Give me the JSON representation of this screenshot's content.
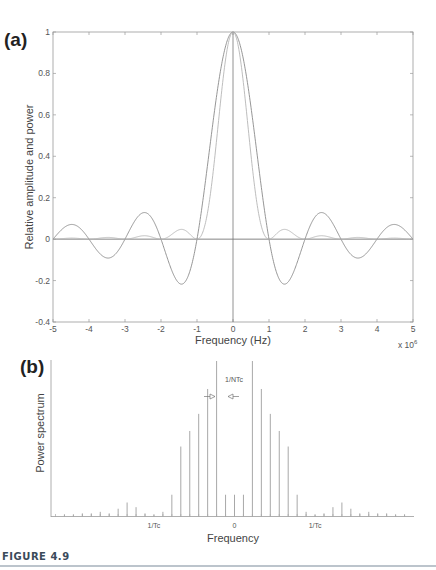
{
  "figure": {
    "caption": "FIGURE 4.9"
  },
  "chart_data": [
    {
      "panel_label": "(a)",
      "type": "line",
      "title": "",
      "xlabel": "Frequency (Hz)",
      "x_multiplier_label": "x 10",
      "x_multiplier_exponent": "6",
      "ylabel": "Relative amplitude and power",
      "xlim": [
        -5,
        5
      ],
      "ylim": [
        -0.4,
        1
      ],
      "xticks": [
        -5,
        -4,
        -3,
        -2,
        -1,
        0,
        1,
        2,
        3,
        4,
        5
      ],
      "xtick_labels": [
        "-5",
        "-4",
        "-3",
        "-2",
        "-1",
        "0",
        "1",
        "2",
        "3",
        "4",
        "5"
      ],
      "yticks": [
        -0.4,
        -0.2,
        0,
        0.2,
        0.4,
        0.6,
        0.8,
        1
      ],
      "ytick_labels": [
        "-0.4",
        "-0.2",
        "0",
        "0.2",
        "0.4",
        "0.6",
        "0.8",
        "1"
      ],
      "grid": false,
      "legend": "none",
      "series": [
        {
          "name": "Relative amplitude (sinc)",
          "function": "sin(pi*x)/(pi*x)",
          "color": "#8a8a8a",
          "key_points": {
            "x": [
              -4.5,
              -3.45,
              -2.46,
              -1.43,
              0,
              1.43,
              2.46,
              3.45,
              4.5
            ],
            "y": [
              0.07,
              -0.09,
              0.13,
              -0.22,
              1,
              -0.22,
              0.13,
              -0.09,
              0.07
            ]
          }
        },
        {
          "name": "Relative power (sinc squared)",
          "function": "(sin(pi*x)/(pi*x))^2",
          "color": "#b5b5b5",
          "key_points": {
            "x": [
              -1.43,
              0,
              1.43
            ],
            "y": [
              0.047,
              1,
              0.047
            ]
          }
        }
      ],
      "reference_lines": [
        {
          "type": "horizontal",
          "y": 0
        },
        {
          "type": "vertical",
          "x": 0
        }
      ]
    },
    {
      "panel_label": "(b)",
      "type": "bar",
      "title": "",
      "xlabel": "Frequency",
      "ylabel": "Power spectrum",
      "x_units": "1/NTc spacing",
      "xlim": [
        -20,
        20
      ],
      "x_tick_annotations": [
        {
          "x": -9,
          "label": "1/Tc"
        },
        {
          "x": 0,
          "label": "0"
        },
        {
          "x": 9,
          "label": "1/Tc"
        }
      ],
      "spacing_annotation": "1/NTc",
      "envelope": "sinc squared, spectral lines at multiples of 1/NTc, nulls at multiples of 1/Tc",
      "lines": {
        "x": [
          -19,
          -18,
          -17,
          -16,
          -15,
          -14,
          -13,
          -12,
          -11,
          -10,
          -9,
          -8,
          -7,
          -6,
          -5,
          -4,
          -3,
          -2,
          -1,
          0,
          1,
          2,
          3,
          4,
          5,
          6,
          7,
          8,
          9,
          10,
          11,
          12,
          13,
          14,
          15,
          16,
          17,
          18,
          19
        ],
        "y": [
          0.01,
          0.01,
          0.02,
          0.02,
          0.03,
          0.02,
          0.05,
          0.09,
          0.06,
          0.02,
          0.01,
          0.03,
          0.14,
          0.45,
          0.55,
          0.66,
          0.82,
          1.0,
          0.14,
          0.14,
          0.14,
          1.0,
          0.82,
          0.66,
          0.55,
          0.45,
          0.14,
          0.03,
          0.01,
          0.02,
          0.06,
          0.09,
          0.05,
          0.02,
          0.03,
          0.02,
          0.02,
          0.01,
          0.01
        ]
      }
    }
  ]
}
